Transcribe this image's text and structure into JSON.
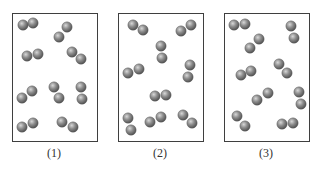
{
  "figure": {
    "sphere_radius": 5.2,
    "sphere_color_light": "#d8d8d8",
    "sphere_color_mid": "#8e8e8e",
    "sphere_color_dark": "#4a4a4a",
    "border_color": "#3f3f3f",
    "panels": [
      {
        "label": "(1)",
        "box": {
          "x": 12,
          "y": 13,
          "w": 85,
          "h": 128
        },
        "label_x": 54,
        "molecules": [
          [
            [
              23,
              25
            ],
            [
              33,
              23
            ]
          ],
          [
            [
              59,
              37
            ],
            [
              67,
              27
            ]
          ],
          [
            [
              27,
              56
            ],
            [
              38,
              54
            ]
          ],
          [
            [
              72,
              52
            ],
            [
              81,
              59
            ]
          ],
          [
            [
              22,
              98
            ],
            [
              32,
              91
            ]
          ],
          [
            [
              54,
              87
            ],
            [
              59,
              98
            ]
          ],
          [
            [
              81,
              87
            ],
            [
              82,
              99
            ]
          ],
          [
            [
              22,
              127
            ],
            [
              33,
              123
            ]
          ],
          [
            [
              62,
              122
            ],
            [
              73,
              127
            ]
          ]
        ]
      },
      {
        "label": "(2)",
        "box": {
          "x": 118,
          "y": 13,
          "w": 85,
          "h": 128
        },
        "label_x": 160,
        "molecules": [
          [
            [
              133,
              25
            ],
            [
              143,
              30
            ]
          ],
          [
            [
              181,
              31
            ],
            [
              191,
              25
            ]
          ],
          [
            [
              161,
              46
            ],
            [
              162,
              58
            ]
          ],
          [
            [
              128,
              73
            ],
            [
              139,
              69
            ]
          ],
          [
            [
              190,
              65
            ],
            [
              188,
              77
            ]
          ],
          [
            [
              155,
              96
            ],
            [
              166,
              95
            ]
          ],
          [
            [
              128,
              118
            ],
            [
              131,
              130
            ]
          ],
          [
            [
              150,
              122
            ],
            [
              161,
              117
            ]
          ],
          [
            [
              183,
              115
            ],
            [
              192,
              123
            ]
          ]
        ]
      },
      {
        "label": "(3)",
        "box": {
          "x": 224,
          "y": 13,
          "w": 85,
          "h": 128
        },
        "label_x": 266,
        "molecules": [
          [
            [
              234,
              25
            ],
            [
              245,
              24
            ]
          ],
          [
            [
              291,
              26
            ],
            [
              294,
              38
            ]
          ],
          [
            [
              250,
              48
            ],
            [
              259,
              39
            ]
          ],
          [
            [
              279,
              64
            ],
            [
              287,
              73
            ]
          ],
          [
            [
              241,
              75
            ],
            [
              251,
              71
            ]
          ],
          [
            [
              257,
              100
            ],
            [
              268,
              93
            ]
          ],
          [
            [
              299,
              92
            ],
            [
              301,
              104
            ]
          ],
          [
            [
              237,
              116
            ],
            [
              245,
              126
            ]
          ],
          [
            [
              282,
              124
            ],
            [
              293,
              123
            ]
          ]
        ]
      }
    ]
  }
}
